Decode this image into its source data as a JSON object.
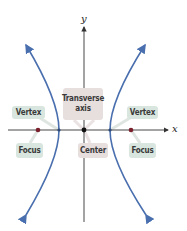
{
  "diagram": {
    "axes": {
      "x_label": "x",
      "y_label": "y"
    },
    "labels": {
      "transverse_axis": "Transverse axis",
      "vertex_left": "Vertex",
      "vertex_right": "Vertex",
      "focus_left": "Focus",
      "focus_right": "Focus",
      "center": "Center"
    },
    "colors": {
      "curve": "#4a6fae",
      "focus_point": "#7a1f2b",
      "center_point": "#111111",
      "axis": "#333333",
      "label_green": "#d9e6df",
      "label_pink": "#e7dede",
      "leader_line": "#dde4df"
    },
    "points": {
      "center": [
        84,
        130
      ],
      "focus_left": [
        38,
        130
      ],
      "focus_right": [
        131,
        130
      ],
      "vertex_left": [
        59,
        130
      ],
      "vertex_right": [
        110,
        130
      ]
    }
  }
}
